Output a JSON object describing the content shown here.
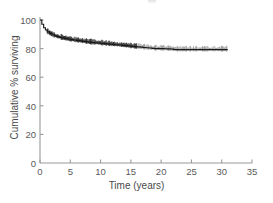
{
  "chart_data": {
    "type": "line",
    "title": "",
    "subtitle": "",
    "xlabel": "Time (years)",
    "ylabel": "Cumulative % surviving",
    "xlim": [
      0,
      35
    ],
    "ylim": [
      0,
      100
    ],
    "xticks": [
      "0",
      "5",
      "10",
      "15",
      "20",
      "25",
      "30",
      "35"
    ],
    "xtick_values": [
      0,
      5,
      10,
      15,
      20,
      25,
      30,
      35
    ],
    "yticks": [
      "0",
      "20",
      "40",
      "60",
      "80",
      "100"
    ],
    "ytick_values": [
      0,
      20,
      40,
      60,
      80,
      100
    ],
    "grid": false,
    "legend": null,
    "annotations": [],
    "series": [
      {
        "name": "Cumulative survival",
        "style": "step",
        "color": "#1a1a1a",
        "censor_marks": true,
        "x": [
          0,
          0.3,
          0.6,
          0.9,
          1.2,
          1.6,
          2.0,
          2.4,
          2.8,
          3.2,
          3.6,
          4.0,
          4.5,
          5.0,
          5.5,
          6.0,
          6.5,
          7.0,
          7.5,
          8.0,
          8.5,
          9.0,
          9.5,
          10.0,
          10.5,
          11.0,
          11.5,
          12.0,
          12.5,
          13.0,
          13.5,
          14.0,
          14.5,
          15.0,
          15.5,
          16.0,
          16.5,
          17.0,
          17.5,
          18.0,
          18.5,
          19.0,
          19.5,
          20.0,
          20.5,
          21.0,
          21.5,
          22.0,
          22.5,
          23.0,
          24.0,
          25.0,
          26.0,
          27.0,
          28.0,
          29.0,
          30.0,
          31.0
        ],
        "y": [
          100.0,
          97.0,
          94.6,
          93.0,
          91.8,
          90.6,
          89.7,
          89.0,
          88.4,
          87.9,
          87.5,
          87.1,
          86.7,
          86.3,
          86.0,
          85.7,
          85.4,
          85.1,
          84.8,
          84.5,
          84.3,
          84.1,
          83.9,
          83.7,
          83.5,
          83.3,
          83.1,
          82.9,
          82.7,
          82.5,
          82.3,
          82.1,
          81.9,
          81.6,
          81.4,
          81.2,
          81.0,
          80.8,
          80.6,
          80.4,
          80.2,
          80.0,
          80.0,
          80.0,
          79.9,
          79.8,
          79.7,
          79.4,
          79.3,
          79.3,
          79.3,
          79.3,
          79.3,
          79.3,
          79.3,
          79.3,
          79.3,
          79.3
        ]
      }
    ]
  },
  "axes": {
    "axis_color": "#9a9a9a",
    "curve_color": "#1a1a1a",
    "tick_label_color": "#5a5a5a"
  }
}
